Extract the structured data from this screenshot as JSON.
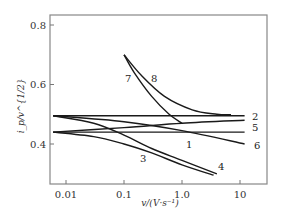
{
  "chart_data": {
    "type": "line",
    "title": "",
    "xlabel": "v/(V·s⁻¹)",
    "ylabel": "i_p/v^{1/2}",
    "xscale": "log",
    "xlim": [
      0.006,
      16
    ],
    "ylim": [
      0.27,
      0.83
    ],
    "grid": false,
    "legend": "inline curve numbers",
    "x_ticks": [
      {
        "value": 0.01,
        "label": "0.01"
      },
      {
        "value": 0.1,
        "label": "0.1"
      },
      {
        "value": 1.0,
        "label": "1.0"
      },
      {
        "value": 10,
        "label": "10"
      }
    ],
    "y_ticks": [
      {
        "value": 0.4,
        "label": "0.4"
      },
      {
        "value": 0.6,
        "label": "0.6"
      },
      {
        "value": 0.8,
        "label": "0.8"
      }
    ],
    "series": [
      {
        "name": "1",
        "x": [
          0.006,
          0.1,
          1.0,
          12
        ],
        "y": [
          0.44,
          0.44,
          0.44,
          0.44
        ]
      },
      {
        "name": "2",
        "x": [
          0.006,
          0.1,
          1.0,
          12
        ],
        "y": [
          0.495,
          0.495,
          0.495,
          0.495
        ]
      },
      {
        "name": "3",
        "x": [
          0.006,
          0.03,
          0.1,
          0.3,
          1.0,
          3.5
        ],
        "y": [
          0.44,
          0.425,
          0.4,
          0.37,
          0.33,
          0.295
        ]
      },
      {
        "name": "4",
        "x": [
          0.006,
          0.03,
          0.1,
          0.3,
          1.0,
          4.0
        ],
        "y": [
          0.495,
          0.47,
          0.43,
          0.385,
          0.345,
          0.3
        ]
      },
      {
        "name": "5",
        "x": [
          0.006,
          0.1,
          1.0,
          12
        ],
        "y": [
          0.44,
          0.455,
          0.47,
          0.48
        ]
      },
      {
        "name": "6",
        "x": [
          0.006,
          0.1,
          1.0,
          12
        ],
        "y": [
          0.495,
          0.475,
          0.445,
          0.4
        ]
      },
      {
        "name": "7",
        "x": [
          0.1,
          0.15,
          0.3,
          0.6,
          1.0
        ],
        "y": [
          0.7,
          0.64,
          0.56,
          0.5,
          0.47
        ]
      },
      {
        "name": "8",
        "x": [
          0.1,
          0.2,
          0.5,
          1.5,
          4.0,
          7.0
        ],
        "y": [
          0.7,
          0.63,
          0.56,
          0.515,
          0.5,
          0.498
        ]
      }
    ]
  },
  "axes": {
    "xlabel": "v/(V·s⁻¹)",
    "ylabel": "i_p/v^{1/2}"
  }
}
